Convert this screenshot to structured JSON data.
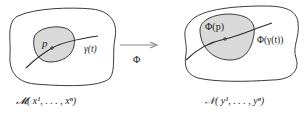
{
  "diagram": {
    "left_manifold": {
      "point_label": "p",
      "curve_label": "γ(t)",
      "caption": "𝓜( x¹, . . . , xⁿ)"
    },
    "map": {
      "label": "Φ"
    },
    "right_manifold": {
      "point_label": "Φ(p)",
      "curve_label": "Φ(γ(t))",
      "caption": "𝒩( y¹, . . . , yⁿ)"
    },
    "colors": {
      "stroke": "#3a3a3a",
      "region_fill": "#d9d9d9",
      "background": "#ffffff",
      "arrow": "#888888"
    }
  }
}
